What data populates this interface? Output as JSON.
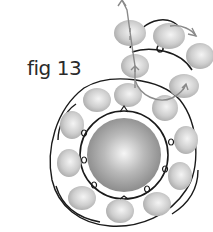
{
  "figure": {
    "label": "fig 13"
  },
  "colors": {
    "background": "#ffffff",
    "thread": "#1a1a1a",
    "thread_path": "#8a8a8a",
    "bead_fill": "#c8c8c8",
    "center_bead": "#a8a8a8"
  },
  "center_bead": {
    "cx": 124,
    "cy": 155,
    "r": 37
  },
  "ring_beads": [
    {
      "cx": 97,
      "cy": 100,
      "rx": 14,
      "ry": 12
    },
    {
      "cx": 128,
      "cy": 95,
      "rx": 14,
      "ry": 12
    },
    {
      "cx": 165,
      "cy": 108,
      "rx": 13,
      "ry": 13
    },
    {
      "cx": 186,
      "cy": 140,
      "rx": 12,
      "ry": 14
    },
    {
      "cx": 180,
      "cy": 176,
      "rx": 12,
      "ry": 14
    },
    {
      "cx": 157,
      "cy": 204,
      "rx": 14,
      "ry": 12
    },
    {
      "cx": 120,
      "cy": 211,
      "rx": 14,
      "ry": 12
    },
    {
      "cx": 82,
      "cy": 198,
      "rx": 14,
      "ry": 12
    },
    {
      "cx": 69,
      "cy": 163,
      "rx": 12,
      "ry": 14
    },
    {
      "cx": 72,
      "cy": 125,
      "rx": 12,
      "ry": 14
    }
  ],
  "spiral_beads": [
    {
      "cx": 130,
      "cy": 33,
      "rx": 16,
      "ry": 13
    },
    {
      "cx": 169,
      "cy": 36,
      "rx": 16,
      "ry": 13
    },
    {
      "cx": 200,
      "cy": 56,
      "rx": 14,
      "ry": 13
    },
    {
      "cx": 135,
      "cy": 66,
      "rx": 14,
      "ry": 12
    },
    {
      "cx": 184,
      "cy": 86,
      "rx": 15,
      "ry": 12
    }
  ]
}
